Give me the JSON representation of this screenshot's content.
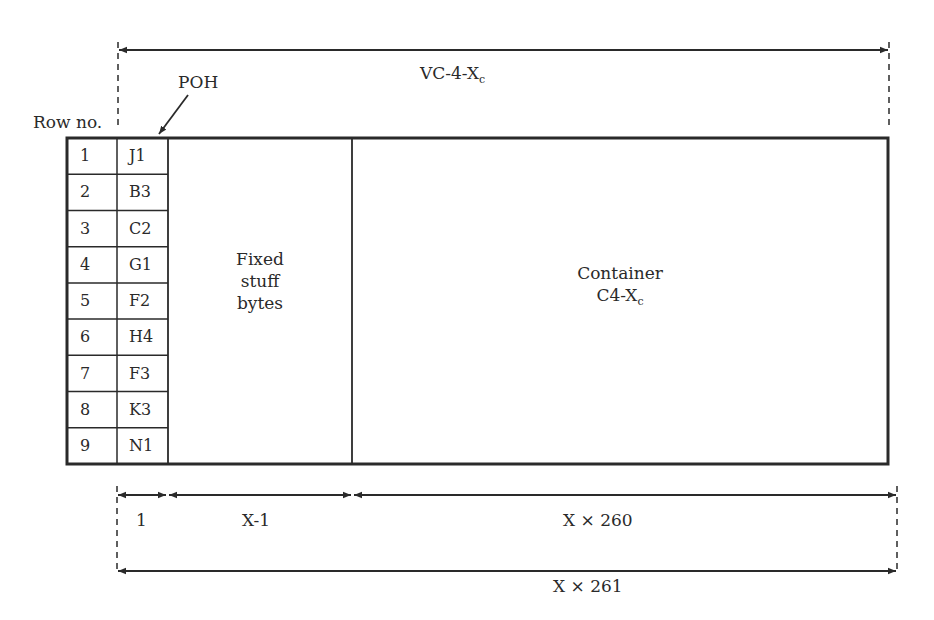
{
  "diagram": {
    "title_top": {
      "main": "VC-4-X",
      "sub": "c"
    },
    "poh_label": "POH",
    "row_no_label": "Row no.",
    "rows": [
      {
        "no": "1",
        "byte": "J1"
      },
      {
        "no": "2",
        "byte": "B3"
      },
      {
        "no": "3",
        "byte": "C2"
      },
      {
        "no": "4",
        "byte": "G1"
      },
      {
        "no": "5",
        "byte": "F2"
      },
      {
        "no": "6",
        "byte": "H4"
      },
      {
        "no": "7",
        "byte": "F3"
      },
      {
        "no": "8",
        "byte": "K3"
      },
      {
        "no": "9",
        "byte": "N1"
      }
    ],
    "fixed_stuff": {
      "line1": "Fixed",
      "line2": "stuff",
      "line3": "bytes"
    },
    "container": {
      "line1": "Container",
      "line2_main": "C4-X",
      "line2_sub": "c"
    },
    "dimensions": {
      "poh_width": "1",
      "fixed_stuff_width": "X-1",
      "container_width": "X × 260",
      "total_width": "X × 261"
    },
    "colors": {
      "line": "#2a2a2a",
      "background": "#ffffff"
    }
  }
}
